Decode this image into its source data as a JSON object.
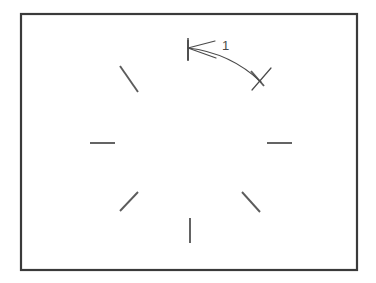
{
  "figure": {
    "background_color": "#ffffff",
    "frame": {
      "name": "border-rectangle",
      "x": 21,
      "y": 14,
      "width": 336,
      "height": 256,
      "stroke_color": "#3a3a3a",
      "stroke_width": 2.2
    },
    "ticks": {
      "stroke_color": "#5c5c5c",
      "stroke_width": 1.9,
      "center": {
        "x": 190,
        "y": 143
      },
      "count": 8,
      "items": [
        {
          "name": "tick-top",
          "position": "top",
          "x1": 188,
          "y1": 40,
          "x2": 188,
          "y2": 60
        },
        {
          "name": "tick-upper-right",
          "position": "upper-right",
          "x1": 251,
          "y1": 71,
          "x2": 264,
          "y2": 86
        },
        {
          "name": "tick-right",
          "position": "right",
          "x1": 267,
          "y1": 143,
          "x2": 292,
          "y2": 143
        },
        {
          "name": "tick-lower-right",
          "position": "lower-right",
          "x1": 242,
          "y1": 192,
          "x2": 260,
          "y2": 212
        },
        {
          "name": "tick-bottom",
          "position": "bottom",
          "x1": 190,
          "y1": 218,
          "x2": 190,
          "y2": 243
        },
        {
          "name": "tick-lower-left",
          "position": "lower-left",
          "x1": 120,
          "y1": 211,
          "x2": 138,
          "y2": 192
        },
        {
          "name": "tick-left",
          "position": "left",
          "x1": 90,
          "y1": 143,
          "x2": 115,
          "y2": 143
        },
        {
          "name": "tick-upper-left",
          "position": "upper-left",
          "x1": 120,
          "y1": 66,
          "x2": 138,
          "y2": 92
        }
      ]
    },
    "dimension": {
      "name": "dimension-leader-1",
      "label": "1",
      "label_x": 226,
      "label_y": 48,
      "stroke_color": "#4a4a4a",
      "arrow_tip": {
        "x": 188,
        "y": 48
      },
      "curve_path": "M 188 48 C 214 51 240 62 261 82",
      "barb_upper": "M 188 48 L 215 41",
      "barb_lower": "M 188 48 L 216 58",
      "extension_stem": "M 188 38 L 188 61",
      "end_mark": "M 252 90 L 271 68"
    }
  }
}
